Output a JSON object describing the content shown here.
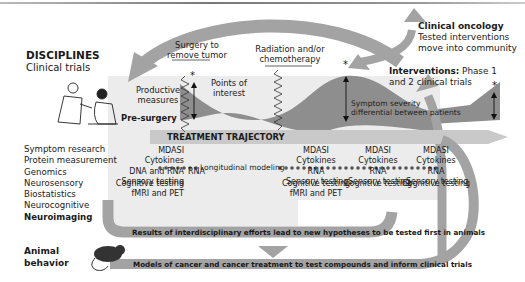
{
  "disciplines": {
    "title": "DISCIPLINES",
    "subtitle": "Clinical trials",
    "list": [
      "Symptom research",
      "Protein measurement",
      "Genomics",
      "Neurosensory",
      "Biostatistics",
      "Neurocognitive",
      "Neuroimaging"
    ],
    "animal_label_line1": "Animal",
    "animal_label_line2": "behavior"
  },
  "timeline": {
    "surgery_line1": "Surgery to",
    "surgery_line2": "remove tumor",
    "radiation_line1": "Radiation and/or",
    "radiation_line2": "chemotherapy",
    "productive_line1": "Productive",
    "productive_line2": "measures",
    "points_line1": "Points of",
    "points_line2": "interest",
    "pre_surgery": "Pre-surgery",
    "severity_line1": "Symptom severity",
    "severity_line2": "differential between patients",
    "asterisk": "*",
    "band_label": "TREATMENT TRAJECTORY"
  },
  "clinical_oncology": {
    "title": "Clinical oncology",
    "line1": "Tested interventions",
    "line2": "move into community"
  },
  "interventions": {
    "title": "Interventions:",
    "line1_rest": " Phase 1",
    "line2": "and 2 clinical trials"
  },
  "measures": {
    "pre": [
      "MDASI",
      "Cytokines",
      "DNA and RNA",
      "Sensory testing"
    ],
    "pre_extra": "RNA",
    "pre_bottom": [
      "Cognitive testing",
      "fMRI and PET"
    ],
    "col2": [
      "MDASI",
      "Cytokines",
      "RNA",
      "Sensory testing"
    ],
    "col2_bottom": [
      "Cognitive testing",
      "fMRI and PET"
    ],
    "col3": [
      "MDASI",
      "Cytokines",
      "RNA",
      "Sensory testing"
    ],
    "col3_bottom": [
      "Cognitive testing"
    ],
    "col4": [
      "MDASI",
      "Cytokines",
      "RNA",
      "Sensory testing"
    ],
    "col4_bottom": [
      "Cognitive testing"
    ],
    "longitudinal": "Longitudinal modeling"
  },
  "bars": {
    "results": "Results of interdisciplinary efforts lead to new hypotheses to be tested first in animals",
    "models": "Models of cancer and cancer treatment to test compounds and inform clinical trials"
  },
  "colors": {
    "arrow_gray": "#a3a3a3",
    "panel_gray": "#e8e8e8",
    "curve_gray": "#8e8e8e",
    "band_gray": "#c9c9c9",
    "dot": "#555555"
  }
}
